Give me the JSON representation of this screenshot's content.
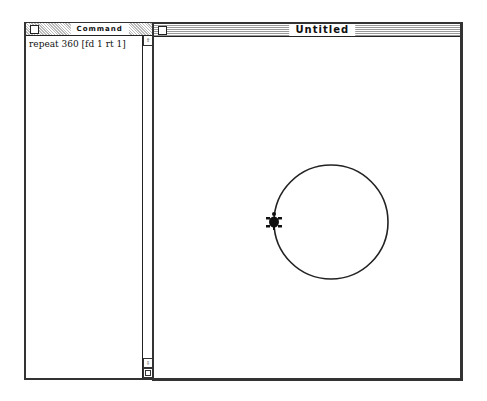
{
  "command_window": {
    "title": "Command",
    "command_text": "repeat 360 [fd 1 rt 1]",
    "scroll_up_icon": "up-arrow-icon",
    "scroll_down_icon": "down-arrow-icon"
  },
  "graphics_window": {
    "title": "Untitled",
    "drawing": {
      "shape": "circle",
      "center_x": 177,
      "center_y": 185,
      "radius": 57,
      "stroke_color": "#222222",
      "turtle_x": 120,
      "turtle_y": 185
    }
  }
}
